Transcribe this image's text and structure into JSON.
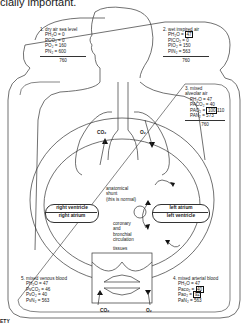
{
  "caption": "cially important.",
  "boxes": {
    "dry_air": {
      "title": "1. dry air sea level",
      "rows": [
        "PH₂O = 0",
        "PCO₂ = 0",
        "PO₂ = 160",
        "PN₂ = 600"
      ],
      "total": "760"
    },
    "wet_air": {
      "title": "2. wet inspired air",
      "rows": [
        "PH₂O = ",
        "PICO₂ = 0",
        "PIO₂ = 150",
        "PIN₂ = 563"
      ],
      "highlight": "47",
      "total": "760"
    },
    "alveolar_air": {
      "title": "3. mixed",
      "subtitle": "alveolar air",
      "rows": [
        "PH₂O = 47",
        "PACO₂ = 40",
        "PAO₂ = ",
        "PAN₂ = 573"
      ],
      "highlight": "100",
      "highlight_suffix": "110",
      "total": "760"
    },
    "arterial_blood": {
      "title": "4. mixed arterial blood",
      "rows": [
        "PH₂O = 47",
        "Paco₂ = ",
        "Pao₂ = ",
        "PaN₂ = 563"
      ],
      "highlight_co2": "40",
      "highlight_o2": "92"
    },
    "venous_blood": {
      "title": "5. mixed venous blood",
      "rows": [
        "PH₂O = 47",
        "PvCO₂ = 46",
        "PvO₂ = 40",
        "PvN₂ = 563"
      ]
    }
  },
  "labels": {
    "co2_lung": "CO₂",
    "o2_lung": "O₂",
    "co2_tissue": "CO₂",
    "o2_tissue": "O₂",
    "right_ventricle": "right ventricle",
    "right_atrium": "right atrium",
    "left_atrium": "left atrium",
    "left_ventricle": "left ventricle",
    "shunt": [
      "anatomical",
      "shunt",
      "(this is normal)"
    ],
    "coronary": [
      "coronary",
      "and",
      "bronchial",
      "circulation"
    ],
    "tissues": "tissues"
  },
  "bottom_left": "ETY"
}
